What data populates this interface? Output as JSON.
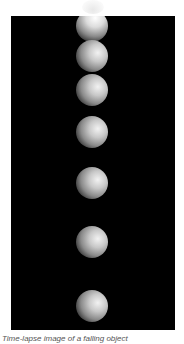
{
  "figure": {
    "caption": "Time-lapse image of a falling object",
    "background_color": "#000000",
    "object": "ball",
    "ball_count": 7,
    "balls": [
      {
        "cx": 81,
        "cy": 10,
        "r": 16,
        "glow": true
      },
      {
        "cx": 81,
        "cy": 40,
        "r": 16
      },
      {
        "cx": 81,
        "cy": 74,
        "r": 16
      },
      {
        "cx": 81,
        "cy": 116,
        "r": 16
      },
      {
        "cx": 81,
        "cy": 167,
        "r": 16
      },
      {
        "cx": 81,
        "cy": 226,
        "r": 16
      },
      {
        "cx": 81,
        "cy": 290,
        "r": 16
      }
    ]
  }
}
